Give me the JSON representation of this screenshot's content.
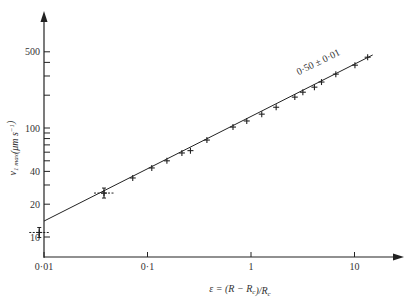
{
  "chart_data": {
    "type": "scatter",
    "title": "",
    "xlabel": "ε = (R − R_c)/R_c",
    "ylabel": "v_1max (μm s⁻¹)",
    "xscale": "log",
    "yscale": "log",
    "xlim": [
      0.01,
      20
    ],
    "ylim": [
      7,
      900
    ],
    "grid": false,
    "legend": null,
    "x_ticks": [
      {
        "value": 0.01,
        "label": "0·01"
      },
      {
        "value": 0.1,
        "label": "0·1"
      },
      {
        "value": 1,
        "label": "1"
      },
      {
        "value": 10,
        "label": "10"
      }
    ],
    "y_ticks": [
      {
        "value": 10,
        "label": "10"
      },
      {
        "value": 20,
        "label": "20"
      },
      {
        "value": 40,
        "label": "40"
      },
      {
        "value": 100,
        "label": "100"
      },
      {
        "value": 500,
        "label": "500"
      }
    ],
    "y_minor_ticks": [
      30,
      50,
      60,
      70,
      80,
      90,
      200,
      300,
      400
    ],
    "series": [
      {
        "name": "measurements",
        "marker": "+",
        "x": [
          0.009,
          0.038,
          0.072,
          0.11,
          0.154,
          0.215,
          0.26,
          0.375,
          0.67,
          0.91,
          1.27,
          1.75,
          2.65,
          3.17,
          4.1,
          4.8,
          6.6,
          10.1,
          13.4
        ],
        "y": [
          11,
          25.3,
          34.8,
          43,
          50,
          59,
          62,
          77.5,
          102,
          116,
          134,
          155,
          192,
          213,
          237,
          264,
          312,
          377,
          446
        ]
      }
    ],
    "fit_line": {
      "slope": 0.5,
      "x": [
        0.01,
        15
      ],
      "y": [
        14.0,
        468
      ]
    },
    "annotations": [
      {
        "text": "0·50 ± 0·01",
        "x": 3.0,
        "y": 280
      }
    ]
  },
  "labels": {
    "xlabel_text": "ε = (R − R",
    "ylabel_text": "v"
  }
}
